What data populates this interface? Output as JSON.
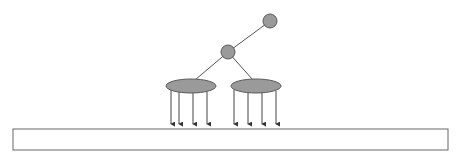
{
  "diagram": {
    "type": "tree-hierarchy",
    "colors": {
      "node_fill": "#9a9a9a",
      "node_stroke": "#5a5a5a",
      "edge": "#555555",
      "arrow": "#333333",
      "bar_stroke": "#666666",
      "bar_fill": "#ffffff"
    },
    "root": {
      "cx": 270,
      "cy": 21,
      "r": 7
    },
    "middle": {
      "cx": 228,
      "cy": 52,
      "r": 7
    },
    "groups": [
      {
        "cx": 191,
        "cy": 86,
        "rx": 25,
        "ry": 7,
        "arrows_x": [
          171,
          179,
          193,
          207
        ]
      },
      {
        "cx": 256,
        "cy": 86,
        "rx": 25,
        "ry": 7,
        "arrows_x": [
          234,
          248,
          262,
          276
        ]
      }
    ],
    "arrow_bottom_y": 127,
    "bar": {
      "x": 13,
      "y": 129,
      "width": 435,
      "height": 21
    }
  }
}
